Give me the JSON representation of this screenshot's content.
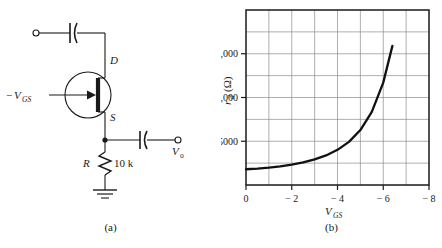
{
  "figure": {
    "panels": [
      {
        "id": "a",
        "caption": "(a)",
        "type": "circuit"
      },
      {
        "id": "b",
        "caption": "(b)",
        "type": "chart"
      }
    ]
  },
  "circuit": {
    "title": "JFET source-follower with gate bias",
    "labels": {
      "drain": "D",
      "source": "S",
      "gate_supply_sign": "−",
      "gate_supply_main": "V",
      "gate_supply_sub": "GS",
      "resistor_name": "R",
      "resistor_value": "10 k",
      "output_main": "V",
      "output_sub": "o"
    },
    "components": [
      {
        "name": "input-terminal",
        "kind": "terminal"
      },
      {
        "name": "input-coupling-capacitor",
        "kind": "capacitor"
      },
      {
        "name": "jfet",
        "kind": "transistor"
      },
      {
        "name": "output-coupling-capacitor",
        "kind": "capacitor"
      },
      {
        "name": "output-terminal",
        "kind": "terminal"
      },
      {
        "name": "source-resistor",
        "kind": "resistor",
        "value": "10 k"
      },
      {
        "name": "ground",
        "kind": "ground"
      }
    ],
    "colors": {
      "wire": "#1a1a1a"
    }
  },
  "chart_data": {
    "type": "line",
    "title": "",
    "xlabel_main": "V",
    "xlabel_sub": "GS",
    "ylabel_main": "r",
    "ylabel_sub": "d",
    "ylabel_unit": "(Ω)",
    "xlim": [
      0,
      -8
    ],
    "ylim": [
      0,
      20000
    ],
    "xticks": [
      0,
      -2,
      -4,
      -6,
      -8
    ],
    "xtick_labels": [
      "0",
      "− 2",
      "− 4",
      "− 6",
      "− 8"
    ],
    "yticks": [
      5000,
      10000,
      15000
    ],
    "ytick_labels": [
      "5000",
      "10,000",
      "15,000"
    ],
    "x_minor_step": 1,
    "y_minor_step": 2500,
    "grid": true,
    "legend": "none",
    "series": [
      {
        "name": "rd-vs-vgs",
        "x": [
          0,
          -0.5,
          -1,
          -1.5,
          -2,
          -2.5,
          -3,
          -3.5,
          -4,
          -4.5,
          -5,
          -5.5,
          -6,
          -6.4
        ],
        "values": [
          1800,
          1880,
          1990,
          2140,
          2330,
          2580,
          2920,
          3380,
          4020,
          4930,
          6280,
          8350,
          11700,
          15900
        ],
        "color": "#111111",
        "width": 2.3
      }
    ]
  }
}
